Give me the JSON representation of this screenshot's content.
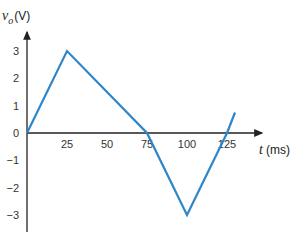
{
  "chart_data": {
    "type": "line",
    "title": "",
    "xlabel": "t (ms)",
    "ylabel": "v_o(V)",
    "ylabel_parts": {
      "var": "v",
      "sub": "o",
      "unit": "(V)"
    },
    "xlabel_parts": {
      "var": "t",
      "unit": "(ms)"
    },
    "x_ticks": [
      25,
      50,
      75,
      100,
      125
    ],
    "y_ticks": [
      3,
      2,
      1,
      0,
      -1,
      -2,
      -3
    ],
    "xlim": [
      0,
      135
    ],
    "ylim": [
      -3.5,
      3.5
    ],
    "grid": false,
    "series": [
      {
        "name": "v_o",
        "color": "#2e86c9",
        "x": [
          0,
          25,
          75,
          100,
          125,
          130
        ],
        "y": [
          0,
          3,
          0,
          -3,
          0,
          0.75
        ]
      }
    ]
  },
  "colors": {
    "line": "#2e86c9",
    "axis": "#222222"
  }
}
